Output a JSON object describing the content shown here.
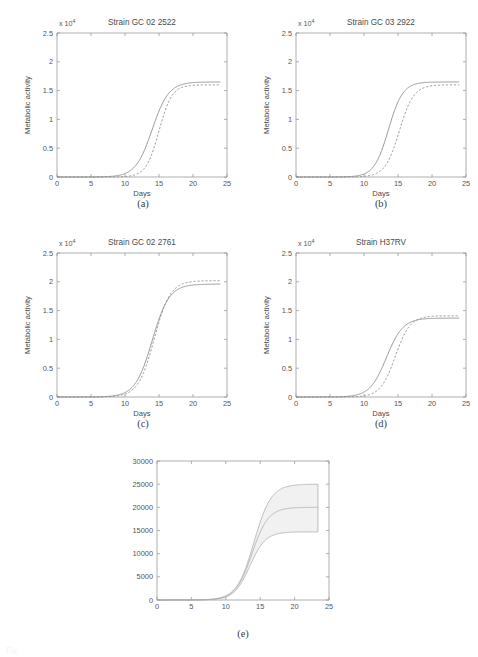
{
  "figure": {
    "background_color": "#ffffff",
    "line_color": "#8c8c8c",
    "band_fill_color": "#f1f1f1",
    "axis_color": "#9a9a9a",
    "caption_partial": "Fig."
  },
  "sublabels": {
    "a": "(a)",
    "b": "(b)",
    "c": "(c)",
    "d": "(d)",
    "e": "(e)"
  },
  "chart_data": [
    {
      "id": "a",
      "type": "line",
      "title": "Strain GC 02 2522",
      "xlabel": "Days",
      "ylabel": "Metabolic activity",
      "exponent_label": "x 10",
      "exponent_sup": "4",
      "xlim": [
        0,
        25
      ],
      "ylim": [
        0,
        25000
      ],
      "xticks": [
        0,
        5,
        10,
        15,
        20,
        25
      ],
      "xticklabels": [
        "0",
        "5",
        "10",
        "15",
        "20",
        "25"
      ],
      "yticks": [
        0,
        5000,
        10000,
        15000,
        20000,
        25000
      ],
      "yticklabels": [
        "0",
        "0.5",
        "1",
        "1.5",
        "2",
        "2.5"
      ],
      "grid": false,
      "legend": "none",
      "series": [
        {
          "name": "model",
          "style": "solid",
          "model": "logistic",
          "plateau": 16500,
          "midpoint": 14.0,
          "rate": 0.82,
          "x_end": 24.0
        },
        {
          "name": "data",
          "style": "dashed",
          "model": "logistic",
          "plateau": 16000,
          "midpoint": 15.0,
          "rate": 1.05,
          "x_end": 24.0
        }
      ]
    },
    {
      "id": "b",
      "type": "line",
      "title": "Strain GC 03 2922",
      "xlabel": "Days",
      "ylabel": "Metabolic activity",
      "exponent_label": "x 10",
      "exponent_sup": "4",
      "xlim": [
        0,
        25
      ],
      "ylim": [
        0,
        25000
      ],
      "xticks": [
        0,
        5,
        10,
        15,
        20,
        25
      ],
      "xticklabels": [
        "0",
        "5",
        "10",
        "15",
        "20",
        "25"
      ],
      "yticks": [
        0,
        5000,
        10000,
        15000,
        20000,
        25000
      ],
      "yticklabels": [
        "0",
        "0.5",
        "1",
        "1.5",
        "2",
        "2.5"
      ],
      "grid": false,
      "legend": "none",
      "series": [
        {
          "name": "model",
          "style": "solid",
          "model": "logistic",
          "plateau": 16500,
          "midpoint": 13.6,
          "rate": 0.95,
          "x_end": 24.0
        },
        {
          "name": "data",
          "style": "dashed",
          "model": "logistic",
          "plateau": 16000,
          "midpoint": 15.2,
          "rate": 0.95,
          "x_end": 24.0
        }
      ]
    },
    {
      "id": "c",
      "type": "line",
      "title": "Strain GC 02 2761",
      "xlabel": "Days",
      "ylabel": "Metabolic activity",
      "exponent_label": "x 10",
      "exponent_sup": "4",
      "xlim": [
        0,
        25
      ],
      "ylim": [
        0,
        25000
      ],
      "xticks": [
        0,
        5,
        10,
        15,
        20,
        25
      ],
      "xticklabels": [
        "0",
        "5",
        "10",
        "15",
        "20",
        "25"
      ],
      "yticks": [
        0,
        5000,
        10000,
        15000,
        20000,
        25000
      ],
      "yticklabels": [
        "0",
        "0.5",
        "1",
        "1.5",
        "2",
        "2.5"
      ],
      "grid": false,
      "legend": "none",
      "series": [
        {
          "name": "model",
          "style": "solid",
          "model": "logistic",
          "plateau": 19600,
          "midpoint": 14.0,
          "rate": 0.8,
          "x_end": 24.0
        },
        {
          "name": "data",
          "style": "dashed",
          "model": "logistic",
          "plateau": 20200,
          "midpoint": 14.3,
          "rate": 0.85,
          "x_end": 24.0
        }
      ]
    },
    {
      "id": "d",
      "type": "line",
      "title": "Strain H37RV",
      "xlabel": "Days",
      "ylabel": "Metabolic activity",
      "exponent_label": "x 10",
      "exponent_sup": "4",
      "xlim": [
        0,
        25
      ],
      "ylim": [
        0,
        25000
      ],
      "xticks": [
        0,
        5,
        10,
        15,
        20,
        25
      ],
      "xticklabels": [
        "0",
        "5",
        "10",
        "15",
        "20",
        "25"
      ],
      "yticks": [
        0,
        5000,
        10000,
        15000,
        20000,
        25000
      ],
      "yticklabels": [
        "0",
        "0.5",
        "1",
        "1.5",
        "2",
        "2.5"
      ],
      "grid": false,
      "legend": "none",
      "series": [
        {
          "name": "model",
          "style": "solid",
          "model": "logistic",
          "plateau": 13700,
          "midpoint": 13.3,
          "rate": 0.82,
          "x_end": 24.0
        },
        {
          "name": "data",
          "style": "dashed",
          "model": "logistic",
          "plateau": 14100,
          "midpoint": 14.6,
          "rate": 0.92,
          "x_end": 24.0
        }
      ]
    },
    {
      "id": "e",
      "type": "area",
      "title": "",
      "xlabel": "",
      "ylabel": "",
      "xlim": [
        0,
        25
      ],
      "ylim": [
        0,
        30000
      ],
      "xticks": [
        0,
        5,
        10,
        15,
        20,
        25
      ],
      "xticklabels": [
        "0",
        "5",
        "10",
        "15",
        "20",
        "25"
      ],
      "yticks": [
        0,
        5000,
        10000,
        15000,
        20000,
        25000,
        30000
      ],
      "yticklabels": [
        "0",
        "5000",
        "10000",
        "15000",
        "20000",
        "25000",
        "30000"
      ],
      "grid": false,
      "legend": "none",
      "band": {
        "upper_name": "upper bound",
        "lower_name": "lower bound",
        "mean_name": "mean"
      },
      "series": [
        {
          "name": "upper bound",
          "style": "solid",
          "model": "logistic",
          "plateau": 25000,
          "midpoint": 14.1,
          "rate": 0.8,
          "x_end": 23.4
        },
        {
          "name": "mean",
          "style": "solid",
          "model": "logistic",
          "plateau": 20000,
          "midpoint": 13.8,
          "rate": 0.84,
          "x_end": 23.4
        },
        {
          "name": "lower bound",
          "style": "solid",
          "model": "logistic",
          "plateau": 14700,
          "midpoint": 13.5,
          "rate": 0.88,
          "x_end": 23.4
        }
      ]
    }
  ]
}
